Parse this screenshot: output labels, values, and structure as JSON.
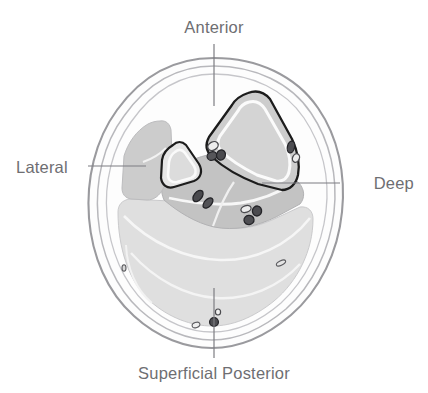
{
  "figure": {
    "type": "anatomical-cross-section",
    "orientation_labels": {
      "anterior": "Anterior",
      "lateral": "Lateral",
      "deep": "Deep",
      "superficial_posterior": "Superficial Posterior"
    },
    "colors": {
      "background": "#ffffff",
      "label_text": "#6e6e72",
      "leader_line": "#7d7d82",
      "skin_outline": "#9a9a9e",
      "fascia_line": "#b4b4b8",
      "subcutaneous_fill": "#fbfbfb",
      "superficial_posterior_fill": "#dfdfdf",
      "deep_compartment_fill": "#c3c3c3",
      "lateral_compartment_fill": "#cccccc",
      "anterior_compartment_fill": "#cdcdcd",
      "anterior_compartment_outline": "#1c1c1c",
      "bone_outline": "#1c1c1c",
      "bone_fill": "#e2e2e2",
      "vessel_dark": "#4e4e52",
      "vessel_outline": "#2a2a2e",
      "vessel_light": "#ececec"
    },
    "leader_lines": [
      {
        "name": "anterior",
        "x1": 214,
        "y1": 44,
        "x2": 214,
        "y2": 106
      },
      {
        "name": "lateral",
        "x1": 88,
        "y1": 166,
        "x2": 146,
        "y2": 166
      },
      {
        "name": "deep",
        "x1": 262,
        "y1": 183,
        "x2": 340,
        "y2": 183
      },
      {
        "name": "superficial-posterior",
        "x1": 214,
        "y1": 288,
        "x2": 214,
        "y2": 358
      }
    ]
  }
}
